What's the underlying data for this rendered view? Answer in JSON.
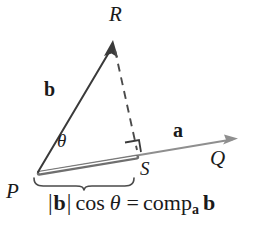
{
  "figure": {
    "background_color": "#ffffff",
    "ink_color": "#1a1a1a",
    "ray_color": "#8a8a8a",
    "points": {
      "P": "P",
      "Q": "Q",
      "R": "R",
      "S": "S"
    },
    "vectors": {
      "b_label": "b",
      "a_label": "a"
    },
    "angle_label": "θ",
    "equation": {
      "abs_open": "|",
      "b_magnitude": "b",
      "abs_close": "|",
      "cos": "cos",
      "theta": "θ",
      "equals": "=",
      "comp": "comp",
      "comp_subscript": "a",
      "comp_operand": "b",
      "full_text": "|b| cos θ = comp_a b"
    },
    "annotations": {
      "right_angle": "right-angle-marker-at-S",
      "brace": "brace-spanning-P-to-S",
      "dashed_segment": "dashed-perpendicular-R-to-S",
      "projection_segment": "highlighted-projection-P-to-S"
    }
  }
}
